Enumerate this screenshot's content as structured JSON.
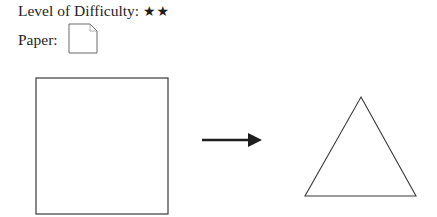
{
  "header": {
    "difficulty_label": "Level of Difficulty:",
    "difficulty_stars": "★★",
    "difficulty_value": 2,
    "paper_label": "Paper:",
    "paper_icon": "paper-square-icon"
  },
  "diagram": {
    "start_shape": "square",
    "arrow": "right-arrow",
    "end_shape": "equilateral-triangle",
    "stroke_color": "#3a3a3a",
    "arrow_color": "#1e1e1e"
  }
}
